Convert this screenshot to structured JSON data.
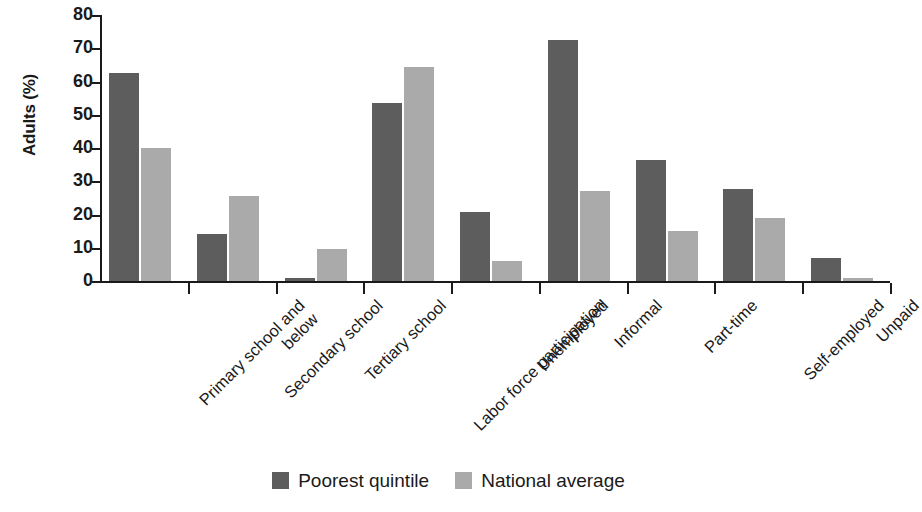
{
  "chart_data": {
    "type": "bar",
    "title": "",
    "xlabel": "",
    "ylabel": "Adults (%)",
    "ylim": [
      0,
      80
    ],
    "ytick_values": [
      0,
      10,
      20,
      30,
      40,
      50,
      60,
      70,
      80
    ],
    "ytick_labels": [
      "0",
      "10",
      "20",
      "30",
      "40",
      "50",
      "60",
      "70",
      "80"
    ],
    "grid": false,
    "legend_position": "bottom-center",
    "categories": [
      "Primary school and\nbelow",
      "Secondary school",
      "Tertiary school",
      "Labor force participation",
      "Unemployed",
      "Informal",
      "Part-time",
      "Self-employed",
      "Unpaid"
    ],
    "series": [
      {
        "name": "Poorest quintile",
        "color": "#5d5d5d",
        "values": [
          62.5,
          14,
          1,
          53.5,
          20.7,
          72.5,
          36.5,
          27.8,
          7
        ]
      },
      {
        "name": "National average",
        "color": "#aaaaaa",
        "values": [
          40,
          25.7,
          9.5,
          64.3,
          6,
          27,
          15,
          19,
          1
        ]
      }
    ]
  },
  "legend": {
    "items": [
      {
        "label": "Poorest quintile",
        "swatch": "dark-swatch-icon"
      },
      {
        "label": "National average",
        "swatch": "light-swatch-icon"
      }
    ]
  }
}
